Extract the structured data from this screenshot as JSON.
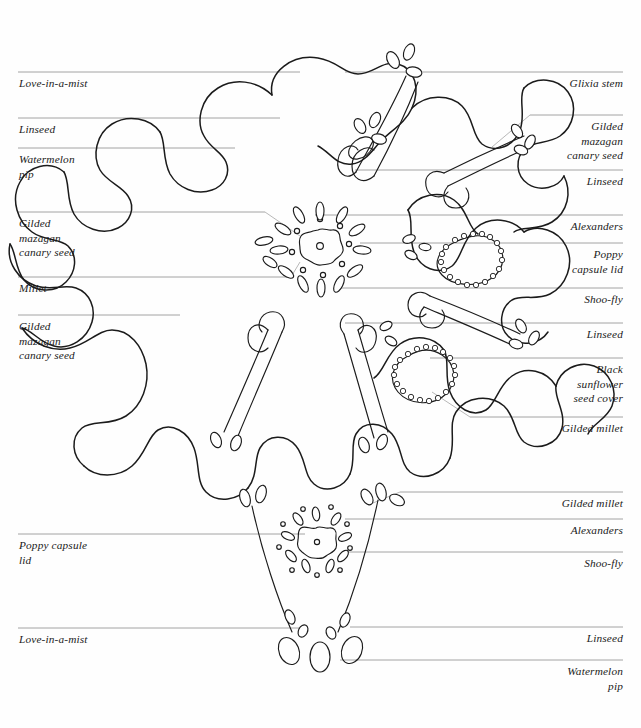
{
  "document": {
    "title": "Seed mosaic annotated key",
    "background_color": "#fefefe",
    "ink_color": "#1b1b1b",
    "rule_color": "#9a9a9a",
    "leader_color": "#b0b0b0"
  },
  "diagrams": [
    {
      "name": "upper-rosette",
      "description": "Large eight-lobed rosette with radiating stems, leaf clusters, beaded teardrop pods and a central seed flower"
    },
    {
      "name": "lower-motif",
      "description": "V-shaped pair of stems with leaf clusters, a small seed flower and oval pips at the base"
    }
  ],
  "labels": {
    "upper_left": [
      {
        "id": "u-l-1",
        "text": "Love-in-a-mist",
        "rule_y": 72,
        "text_y": 76,
        "rule_x2": 300
      },
      {
        "id": "u-l-2",
        "text": "Linseed",
        "rule_y": 118,
        "text_y": 122,
        "rule_x2": 280
      },
      {
        "id": "u-l-3",
        "text": "Watermelon\npip",
        "rule_y": 148,
        "text_y": 152,
        "rule_x2": 235
      },
      {
        "id": "u-l-4",
        "text": "Gilded\nmazagan\ncanary seed",
        "rule_y": 212,
        "text_y": 216,
        "rule_x2": 265
      },
      {
        "id": "u-l-5",
        "text": "Millet",
        "rule_y": 277,
        "text_y": 281,
        "rule_x2": 290
      },
      {
        "id": "u-l-6",
        "text": "Gilded\nmazagan\ncanary seed",
        "rule_y": 315,
        "text_y": 319,
        "rule_x2": 180
      }
    ],
    "upper_right": [
      {
        "id": "u-r-1",
        "text": "Glixia stem",
        "rule_y": 72,
        "text_y": 76,
        "rule_x1": 345
      },
      {
        "id": "u-r-2",
        "text": "Gilded\nmazagan\ncanary seed",
        "rule_y": 115,
        "text_y": 119,
        "rule_x1": 530
      },
      {
        "id": "u-r-3",
        "text": "Linseed",
        "rule_y": 170,
        "text_y": 174,
        "rule_x1": 355
      },
      {
        "id": "u-r-4",
        "text": "Alexanders",
        "rule_y": 215,
        "text_y": 219,
        "rule_x1": 315
      },
      {
        "id": "u-r-5",
        "text": "Poppy\ncapsule lid",
        "rule_y": 243,
        "text_y": 247,
        "rule_x1": 360
      },
      {
        "id": "u-r-6",
        "text": "Shoo-fly",
        "rule_y": 288,
        "text_y": 292,
        "rule_x1": 340
      },
      {
        "id": "u-r-7",
        "text": "Linseed",
        "rule_y": 323,
        "text_y": 327,
        "rule_x1": 345
      },
      {
        "id": "u-r-8",
        "text": "Black\nsunflower\nseed cover",
        "rule_y": 358,
        "text_y": 362,
        "rule_x1": 430
      },
      {
        "id": "u-r-9",
        "text": "Gilded millet",
        "rule_y": 417,
        "text_y": 421,
        "rule_x1": 470
      }
    ],
    "lower_left": [
      {
        "id": "l-l-1",
        "text": "Poppy capsule\nlid",
        "rule_y": 534,
        "text_y": 538,
        "rule_x2": 305
      },
      {
        "id": "l-l-2",
        "text": "Love-in-a-mist",
        "rule_y": 628,
        "text_y": 632,
        "rule_x2": 300
      }
    ],
    "lower_right": [
      {
        "id": "l-r-1",
        "text": "Gilded millet",
        "rule_y": 492,
        "text_y": 496,
        "rule_x1": 400
      },
      {
        "id": "l-r-2",
        "text": "Alexanders",
        "rule_y": 519,
        "text_y": 523,
        "rule_x1": 345
      },
      {
        "id": "l-r-3",
        "text": "Shoo-fly",
        "rule_y": 552,
        "text_y": 556,
        "rule_x1": 345
      },
      {
        "id": "l-r-4",
        "text": "Linseed",
        "rule_y": 627,
        "text_y": 631,
        "rule_x1": 350
      },
      {
        "id": "l-r-5",
        "text": "Watermelon\npip",
        "rule_y": 660,
        "text_y": 664,
        "rule_x1": 340
      }
    ]
  }
}
